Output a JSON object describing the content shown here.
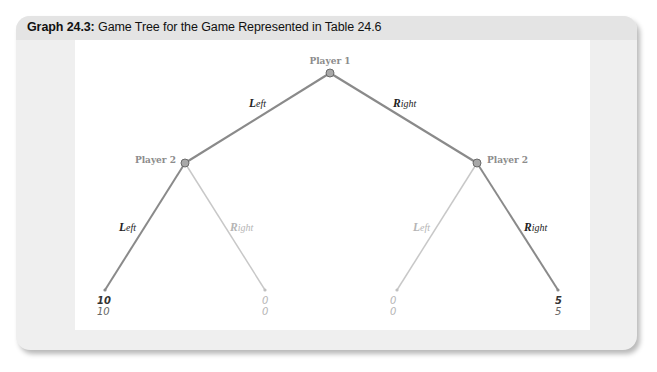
{
  "figure": {
    "caption_label": "Graph 24.3:",
    "caption_text": " Game Tree for the Game Represented in Table 24.6"
  },
  "colors": {
    "card_bg": "#efefef",
    "header_bg": "#e4e4e4",
    "panel_bg": "#ffffff",
    "equilibrium_path": "#8a8a8a",
    "off_path": "#c8c8c8",
    "node_fill": "#a8a8a8",
    "node_stroke": "#6a6a6a",
    "node_label": "#8c8c8c"
  },
  "tree": {
    "root": {
      "label": "Player 1"
    },
    "player2_left": {
      "label": "Player 2"
    },
    "player2_right": {
      "label": "Player 2"
    },
    "edges": {
      "root_left": {
        "cap": "L",
        "rest": "eft",
        "highlighted": true
      },
      "root_right": {
        "cap": "R",
        "rest": "ight",
        "highlighted": true
      },
      "p2l_left": {
        "cap": "L",
        "rest": "eft",
        "highlighted": true
      },
      "p2l_right": {
        "cap": "R",
        "rest": "ight",
        "highlighted": false
      },
      "p2r_left": {
        "cap": "L",
        "rest": "eft",
        "highlighted": false
      },
      "p2r_right": {
        "cap": "R",
        "rest": "ight",
        "highlighted": true
      }
    },
    "leaves": [
      {
        "payoff_player1": "10",
        "payoff_player2": "10",
        "highlighted": true
      },
      {
        "payoff_player1": "0",
        "payoff_player2": "0",
        "highlighted": false
      },
      {
        "payoff_player1": "0",
        "payoff_player2": "0",
        "highlighted": false
      },
      {
        "payoff_player1": "5",
        "payoff_player2": "5",
        "highlighted": true
      }
    ]
  }
}
